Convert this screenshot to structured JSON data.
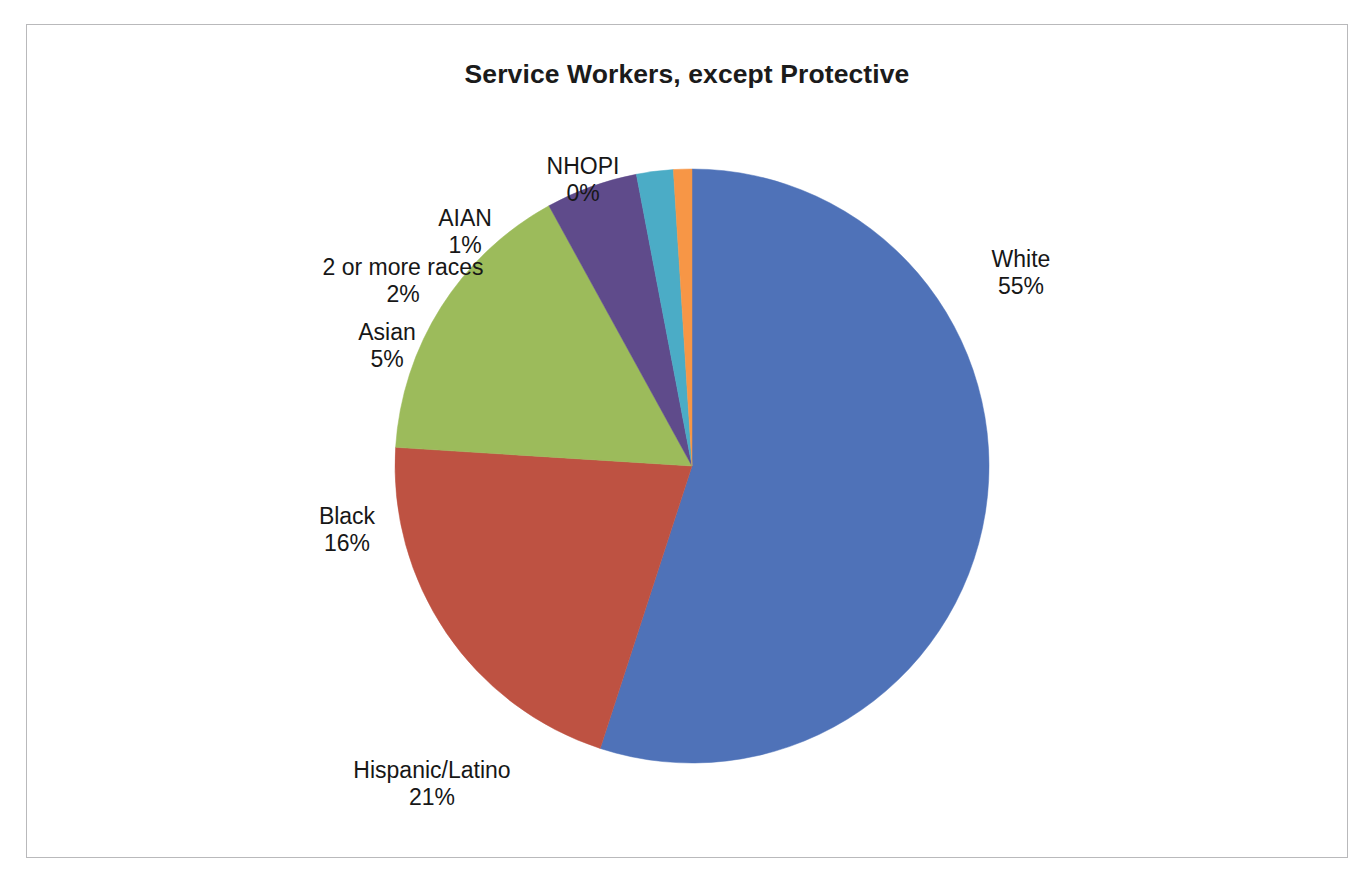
{
  "chart_data": {
    "type": "pie",
    "title": "Service Workers, except Protective",
    "xlabel": "",
    "ylabel": "",
    "legend_position": "none",
    "grid": false,
    "units": "percent",
    "labels": [
      "White",
      "Hispanic/Latino",
      "Black",
      "Asian",
      "2 or more races",
      "AIAN",
      "NHOPI"
    ],
    "values": [
      55,
      21,
      16,
      5,
      2,
      1,
      0
    ],
    "value_texts": [
      "55%",
      "21%",
      "16%",
      "5%",
      "2%",
      "1%",
      "0%"
    ],
    "colors": [
      "#4F72B8",
      "#BE5242",
      "#9CBB5B",
      "#5F4B8B",
      "#4BACC6",
      "#F79646",
      "#F79646"
    ],
    "slices": [
      {
        "label": "White",
        "value": 55,
        "value_text": "55%",
        "color": "#4F72B8"
      },
      {
        "label": "Hispanic/Latino",
        "value": 21,
        "value_text": "21%",
        "color": "#BE5242"
      },
      {
        "label": "Black",
        "value": 16,
        "value_text": "16%",
        "color": "#9CBB5B"
      },
      {
        "label": "Asian",
        "value": 5,
        "value_text": "5%",
        "color": "#5F4B8B"
      },
      {
        "label": "2 or more races",
        "value": 2,
        "value_text": "2%",
        "color": "#4BACC6"
      },
      {
        "label": "AIAN",
        "value": 1,
        "value_text": "1%",
        "color": "#F79646"
      },
      {
        "label": "NHOPI",
        "value": 0,
        "value_text": "0%",
        "color": "#F79646"
      }
    ]
  },
  "chart": {
    "title": "Service Workers, except Protective",
    "labels": {
      "nhopi": {
        "name": "NHOPI",
        "pct": "0%"
      },
      "aian": {
        "name": "AIAN",
        "pct": "1%"
      },
      "two_or_more": {
        "name": "2 or more races",
        "pct": "2%"
      },
      "asian": {
        "name": "Asian",
        "pct": "5%"
      },
      "black": {
        "name": "Black",
        "pct": "16%"
      },
      "hispanic": {
        "name": "Hispanic/Latino",
        "pct": "21%"
      },
      "white": {
        "name": "White",
        "pct": "55%"
      }
    }
  },
  "palette": {
    "white_slice": "#4F72B8",
    "hispanic_slice": "#BE5242",
    "black_slice": "#9CBB5B",
    "asian_slice": "#5F4B8B",
    "two_or_more_slice": "#4BACC6",
    "aian_slice": "#F79646",
    "nhopi_slice": "#F79646",
    "frame_border": "#B9B9BB",
    "text": "#171717",
    "background": "#FFFFFF"
  }
}
